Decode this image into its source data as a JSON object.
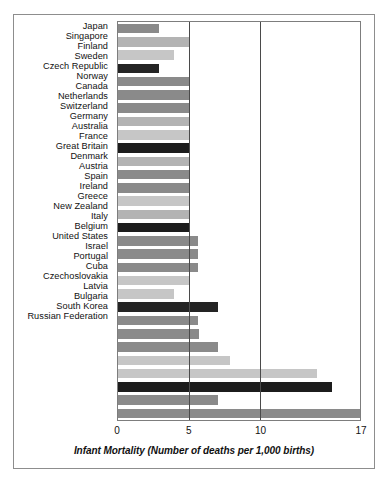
{
  "chart_data": {
    "type": "bar",
    "orientation": "horizontal",
    "title": "",
    "xlabel": "Infant Mortality (Number of deaths per 1,000 births)",
    "ylabel": "",
    "xlim": [
      0,
      17
    ],
    "xticks": [
      "0",
      "5",
      "10",
      "17"
    ],
    "xtick_values": [
      0,
      5,
      10,
      17
    ],
    "gridlines": [
      5,
      10
    ],
    "grid": true,
    "legend": "none",
    "categories": [
      "Japan",
      "Singapore",
      "Finland",
      "Sweden",
      "Czech Republic",
      "Norway",
      "Canada",
      "Netherlands",
      "Switzerland",
      "Germany",
      "Australia",
      "France",
      "Great Britain",
      "Denmark",
      "Austria",
      "Spain",
      "Ireland",
      "Greece",
      "New Zealand",
      "Italy",
      "Belgium",
      "United States",
      "Israel",
      "Portugal",
      "Cuba",
      "Czechoslovakia",
      "Latvia",
      "Bulgaria",
      "South Korea",
      "Russian Federation"
    ],
    "values": [
      2.9,
      5.0,
      3.9,
      2.9,
      5.0,
      5.0,
      5.0,
      5.0,
      5.0,
      5.0,
      5.0,
      5.0,
      5.0,
      5.0,
      5.0,
      5.0,
      5.6,
      5.6,
      5.6,
      5.0,
      3.9,
      7.0,
      5.6,
      5.7,
      7.0,
      7.9,
      14.0,
      15.0,
      7.0,
      17.0
    ],
    "bar_colors": [
      "#8a8a8a",
      "#b3b3b3",
      "#c6c6c6",
      "#242424",
      "#8a8a8a",
      "#8a8a8a",
      "#8a8a8a",
      "#b3b3b3",
      "#c6c6c6",
      "#1c1c1c",
      "#b3b3b3",
      "#8a8a8a",
      "#8a8a8a",
      "#c6c6c6",
      "#b3b3b3",
      "#1c1c1c",
      "#8a8a8a",
      "#8a8a8a",
      "#8a8a8a",
      "#c6c6c6",
      "#c6c6c6",
      "#242424",
      "#8a8a8a",
      "#8a8a8a",
      "#8a8a8a",
      "#c6c6c6",
      "#c6c6c6",
      "#1c1c1c",
      "#8a8a8a",
      "#8a8a8a"
    ]
  },
  "frame": {
    "border_color": "#8d8d8d",
    "background": "#ffffff"
  }
}
